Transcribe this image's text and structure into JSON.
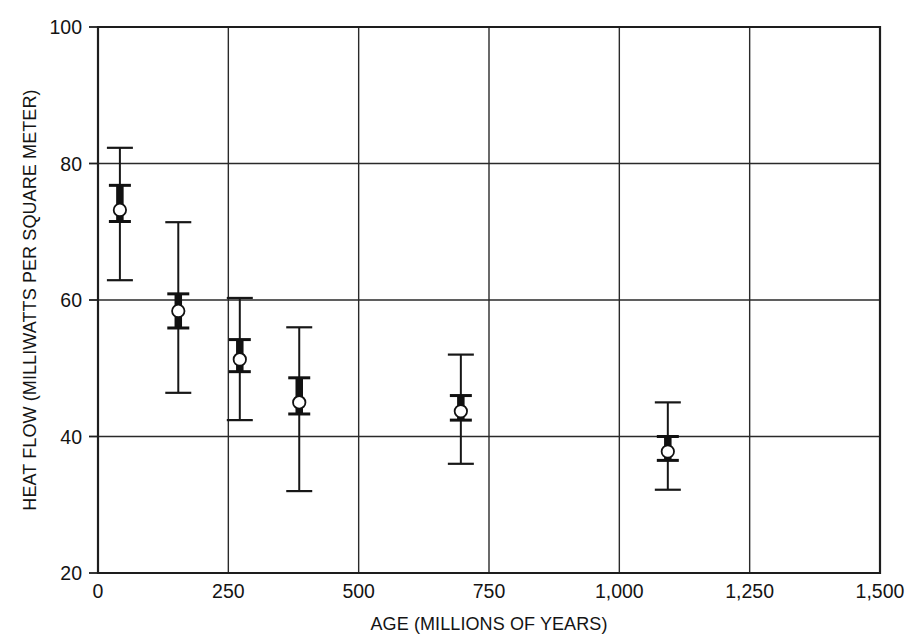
{
  "figure": {
    "background_color": "#ffffff",
    "ink_color": "#171717"
  },
  "chart_data": {
    "type": "scatter",
    "title": "",
    "subtitle": "",
    "xlabel": "AGE (MILLIONS OF YEARS)",
    "ylabel": "HEAT FLOW (MILLIWATTS PER SQUARE METER)",
    "xlim": [
      0,
      1500
    ],
    "ylim": [
      20,
      100
    ],
    "xticks": [
      0,
      250,
      500,
      750,
      1000,
      1250,
      1500
    ],
    "xticklabels": [
      "0",
      "250",
      "500",
      "750",
      "1,000",
      "1,250",
      "1,500"
    ],
    "yticks": [
      20,
      40,
      60,
      80,
      100
    ],
    "yticklabels": [
      "20",
      "40",
      "60",
      "80",
      "100"
    ],
    "grid": "both",
    "legend": "none",
    "annotations": [],
    "marker_style": "open-circle",
    "error_bar_style": "double: thin outer range with caps, thick inner range with caps",
    "series": [
      {
        "name": "Mean heat flow by crustal age group",
        "points": [
          {
            "age": 42,
            "heat_flow": 73.2,
            "outer_low": 62.9,
            "outer_high": 82.3,
            "inner_low": 71.5,
            "inner_high": 76.8
          },
          {
            "age": 154,
            "heat_flow": 58.4,
            "outer_low": 46.4,
            "outer_high": 71.4,
            "inner_low": 55.9,
            "inner_high": 60.9
          },
          {
            "age": 272,
            "heat_flow": 51.3,
            "outer_low": 42.4,
            "outer_high": 60.3,
            "inner_low": 49.5,
            "inner_high": 54.2
          },
          {
            "age": 386,
            "heat_flow": 45.0,
            "outer_low": 32.0,
            "outer_high": 56.0,
            "inner_low": 43.3,
            "inner_high": 48.6
          },
          {
            "age": 696,
            "heat_flow": 43.7,
            "outer_low": 36.0,
            "outer_high": 52.0,
            "inner_low": 42.4,
            "inner_high": 46.0
          },
          {
            "age": 1093,
            "heat_flow": 37.8,
            "outer_low": 32.2,
            "outer_high": 45.0,
            "inner_low": 36.5,
            "inner_high": 40.0
          }
        ]
      }
    ]
  }
}
